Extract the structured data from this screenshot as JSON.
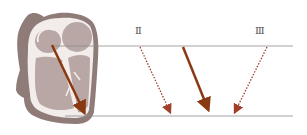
{
  "diagram": {
    "type": "cardiac-vector-projection",
    "labels": {
      "lead_ii": "Ⅱ",
      "lead_iii": "Ⅲ"
    },
    "colors": {
      "heart_outer": "#8f7b78",
      "heart_inner": "#b8a7a4",
      "heart_wall": "#f2ecea",
      "vector_arrow": "#8a3a12",
      "projection_arrow": "#a0402a",
      "reference_line": "#8c8c8c",
      "label": "#555555"
    },
    "reference_lines": {
      "top_y": 46,
      "bottom_y": 116
    },
    "arrows": [
      {
        "name": "heart-vector",
        "style": "solid",
        "from": [
          52,
          45
        ],
        "to": [
          86,
          116
        ]
      },
      {
        "name": "lead-ii-projection",
        "style": "dotted",
        "from": [
          140,
          46
        ],
        "to": [
          171,
          115
        ]
      },
      {
        "name": "mean-vector",
        "style": "solid",
        "from": [
          183,
          46
        ],
        "to": [
          210,
          113
        ]
      },
      {
        "name": "lead-iii-projection",
        "style": "dotted",
        "from": [
          267,
          46
        ],
        "to": [
          233,
          115
        ]
      }
    ]
  }
}
